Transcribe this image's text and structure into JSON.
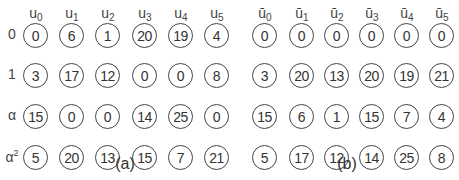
{
  "panels": [
    {
      "id": "a",
      "caption": "(a)",
      "column_labels": [
        {
          "base": "u",
          "sub": "0"
        },
        {
          "base": "u",
          "sub": "1"
        },
        {
          "base": "u",
          "sub": "2"
        },
        {
          "base": "u",
          "sub": "3"
        },
        {
          "base": "u",
          "sub": "4"
        },
        {
          "base": "u",
          "sub": "5"
        }
      ],
      "row_labels": [
        {
          "base": "0",
          "sup": ""
        },
        {
          "base": "1",
          "sup": ""
        },
        {
          "base": "α",
          "sup": ""
        },
        {
          "base": "α",
          "sup": "2"
        }
      ],
      "rows": [
        [
          "0",
          "6",
          "1",
          "20",
          "19",
          "4"
        ],
        [
          "3",
          "17",
          "12",
          "0",
          "0",
          "8"
        ],
        [
          "15",
          "0",
          "0",
          "14",
          "25",
          "0"
        ],
        [
          "5",
          "20",
          "13",
          "15",
          "7",
          "21"
        ]
      ]
    },
    {
      "id": "b",
      "caption": "(b)",
      "column_labels": [
        {
          "base": "ū",
          "sub": "0"
        },
        {
          "base": "ū",
          "sub": "1"
        },
        {
          "base": "ū",
          "sub": "2"
        },
        {
          "base": "ū",
          "sub": "3"
        },
        {
          "base": "ū",
          "sub": "4"
        },
        {
          "base": "ū",
          "sub": "5"
        }
      ],
      "row_labels": [],
      "rows": [
        [
          "0",
          "0",
          "0",
          "0",
          "0",
          "0"
        ],
        [
          "3",
          "20",
          "13",
          "20",
          "19",
          "21"
        ],
        [
          "15",
          "6",
          "1",
          "15",
          "7",
          "4"
        ],
        [
          "5",
          "17",
          "12",
          "14",
          "25",
          "8"
        ]
      ]
    }
  ]
}
